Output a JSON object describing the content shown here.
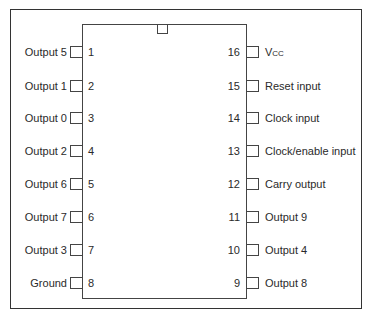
{
  "diagram": {
    "type": "ic-pinout",
    "package": "16-pin DIP",
    "left_pins": [
      {
        "number": "1",
        "label": "Output 5"
      },
      {
        "number": "2",
        "label": "Output 1"
      },
      {
        "number": "3",
        "label": "Output 0"
      },
      {
        "number": "4",
        "label": "Output 2"
      },
      {
        "number": "5",
        "label": "Output 6"
      },
      {
        "number": "6",
        "label": "Output 7"
      },
      {
        "number": "7",
        "label": "Output 3"
      },
      {
        "number": "8",
        "label": "Ground"
      }
    ],
    "right_pins": [
      {
        "number": "16",
        "label": "V",
        "label_sub": "CC"
      },
      {
        "number": "15",
        "label": "Reset input"
      },
      {
        "number": "14",
        "label": "Clock input"
      },
      {
        "number": "13",
        "label": "Clock/enable input"
      },
      {
        "number": "12",
        "label": "Carry output"
      },
      {
        "number": "11",
        "label": "Output 9"
      },
      {
        "number": "10",
        "label": "Output 4"
      },
      {
        "number": "9",
        "label": "Output 8"
      }
    ]
  }
}
